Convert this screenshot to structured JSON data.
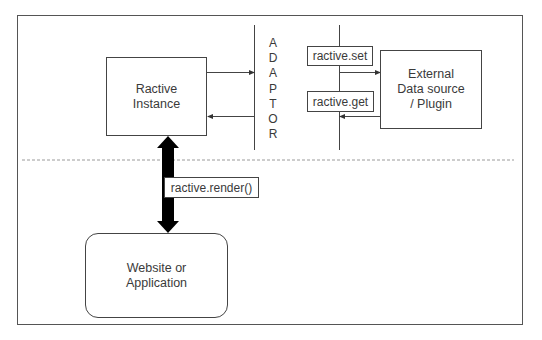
{
  "diagram": {
    "nodes": {
      "ractive_instance": {
        "line1": "Ractive",
        "line2": "Instance"
      },
      "external_source": {
        "line1": "External",
        "line2": "Data source",
        "line3": "/ Plugin"
      },
      "website_app": {
        "line1": "Website or",
        "line2": "Application"
      }
    },
    "adaptor": {
      "letters": [
        "A",
        "D",
        "A",
        "P",
        "T",
        "O",
        "R"
      ]
    },
    "edge_labels": {
      "set": "ractive.set",
      "get": "ractive.get",
      "render": "ractive.render()"
    },
    "edges": [
      {
        "from": "ractive_instance",
        "to": "adaptor",
        "direction": "right"
      },
      {
        "from": "adaptor",
        "to": "ractive_instance",
        "direction": "left"
      },
      {
        "from": "adaptor",
        "to": "external_source",
        "direction": "right",
        "label": "ractive.set"
      },
      {
        "from": "external_source",
        "to": "adaptor",
        "direction": "left",
        "label": "ractive.get"
      },
      {
        "from": "ractive_instance",
        "to": "website_app",
        "direction": "bidirectional",
        "label": "ractive.render()",
        "style": "thick"
      }
    ],
    "colors": {
      "line": "#444444",
      "thick_arrow": "#000000",
      "dashed_separator": "#9a9a9a",
      "text": "#3a3a3a"
    }
  }
}
